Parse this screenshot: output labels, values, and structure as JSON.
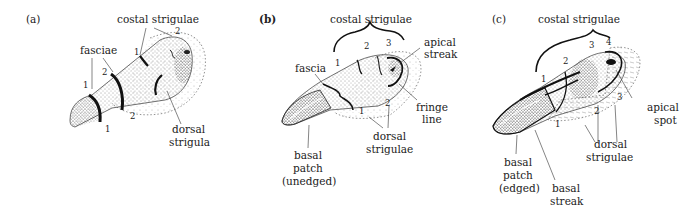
{
  "figure": {
    "panels": [
      {
        "id": "a",
        "letter": "(a)",
        "labels": {
          "costal": "costal strigulae",
          "fasciae": "fasciae",
          "dorsal_1": "dorsal",
          "dorsal_2": "strigula"
        },
        "numbers": {
          "costal_1": "1",
          "costal_2": "2",
          "fascia_upper_1": "1",
          "fascia_upper_2": "2",
          "fascia_lower_1": "1",
          "fascia_lower_2": "2"
        }
      },
      {
        "id": "b",
        "letter": "(b)",
        "labels": {
          "costal": "costal strigulae",
          "fascia": "fascia",
          "apical_1": "apical",
          "apical_2": "streak",
          "fringe_1": "fringe",
          "fringe_2": "line",
          "dorsal_1": "dorsal",
          "dorsal_2": "strigulae",
          "basal_1": "basal",
          "basal_2": "patch",
          "basal_3": "(unedged)"
        },
        "numbers": {
          "costal_1": "1",
          "costal_2": "2",
          "costal_3": "3",
          "dorsal_1": "1",
          "dorsal_2": "2"
        }
      },
      {
        "id": "c",
        "letter": "(c)",
        "labels": {
          "costal": "costal strigulae",
          "apical_1": "apical",
          "apical_2": "spot",
          "dorsal_1": "dorsal",
          "dorsal_2": "strigulae",
          "basal_patch_1": "basal",
          "basal_patch_2": "patch",
          "basal_patch_3": "(edged)",
          "basal_streak_1": "basal",
          "basal_streak_2": "streak"
        },
        "numbers": {
          "costal_1": "1",
          "costal_2": "2",
          "costal_3": "3",
          "costal_4": "4",
          "dorsal_1": "1",
          "dorsal_2": "2",
          "dorsal_3": "3"
        }
      }
    ]
  }
}
